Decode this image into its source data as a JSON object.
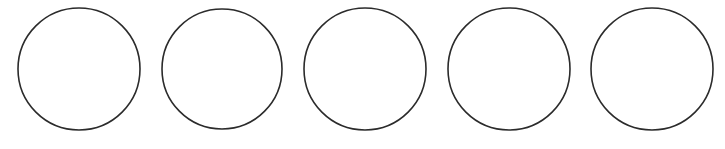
{
  "canvas": {
    "width": 725,
    "height": 149,
    "background": "#ffffff"
  },
  "style": {
    "stroke": "#2b2b2b",
    "stroke_width": 1.6,
    "fill": "#ffffff"
  },
  "circles": [
    {
      "cx": 79,
      "cy": 69,
      "r": 61
    },
    {
      "cx": 222,
      "cy": 69,
      "r": 60
    },
    {
      "cx": 365,
      "cy": 69,
      "r": 61
    },
    {
      "cx": 509,
      "cy": 69,
      "r": 61
    },
    {
      "cx": 652,
      "cy": 69,
      "r": 61
    }
  ]
}
